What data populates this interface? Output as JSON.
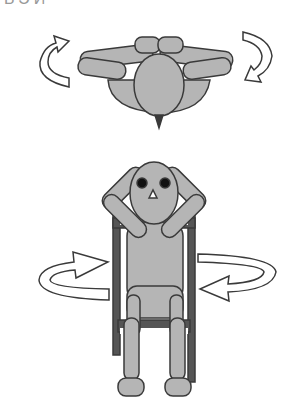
{
  "header": {
    "cropped_text_fragment": "ЬЭЙ"
  },
  "figures": [
    {
      "id": "top-view",
      "description": "Seated figure viewed from above, hands behind head, rotating torso",
      "rotation_arrows": [
        "counter-clockwise-left",
        "clockwise-right"
      ]
    },
    {
      "id": "front-view",
      "description": "Seated figure on chair, front view, hands behind head, horizontal rotation arrows around torso",
      "rotation_arrows": [
        "rotate-right-arrow-left-side",
        "rotate-left-arrow-right-side"
      ]
    }
  ],
  "colors": {
    "body_fill": "#b5b5b5",
    "outline": "#3a3a3a",
    "chair": "#555555",
    "arrow_fill": "#ffffff",
    "eyes": "#111111"
  }
}
